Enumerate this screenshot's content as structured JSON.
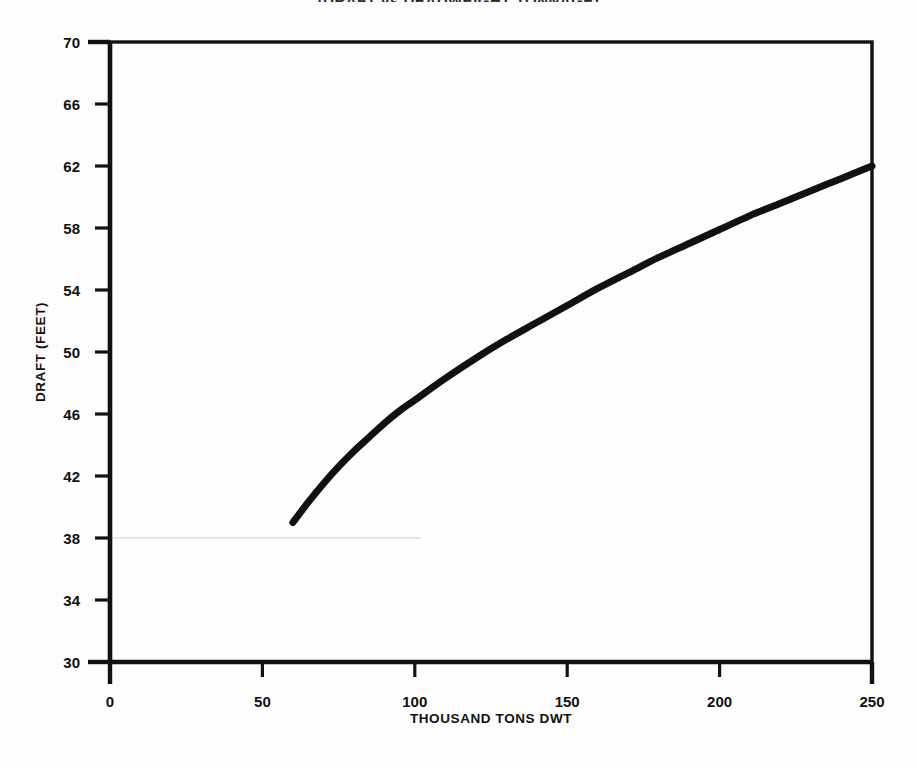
{
  "figure": {
    "clipped_title": "(DRAFT vs DEADWEIGHT TONNAGE)",
    "background_color": "#fdfdfd",
    "ink_color": "#111111"
  },
  "chart_data": {
    "type": "line",
    "title": "",
    "xlabel": "THOUSAND TONS DWT",
    "ylabel": "DRAFT (FEET)",
    "xlim": [
      0,
      250
    ],
    "ylim": [
      30,
      70
    ],
    "xticks": [
      0,
      50,
      100,
      150,
      200,
      250
    ],
    "yticks": [
      30,
      34,
      38,
      42,
      46,
      50,
      54,
      58,
      62,
      66,
      70
    ],
    "xtick_labels": [
      "0",
      "50",
      "100",
      "150",
      "200",
      "250"
    ],
    "ytick_labels": [
      "30",
      "34",
      "38",
      "42",
      "46",
      "50",
      "54",
      "58",
      "62",
      "66",
      "70"
    ],
    "grid": false,
    "legend": null,
    "series": [
      {
        "name": "Draft vs deadweight",
        "line_color": "#111111",
        "line_width": 7,
        "x": [
          60,
          65,
          70,
          75,
          80,
          85,
          90,
          95,
          100,
          110,
          120,
          130,
          140,
          150,
          160,
          170,
          180,
          190,
          200,
          210,
          220,
          230,
          240,
          250
        ],
        "y": [
          39.0,
          40.3,
          41.5,
          42.6,
          43.6,
          44.5,
          45.4,
          46.2,
          46.9,
          48.3,
          49.6,
          50.8,
          51.9,
          53.0,
          54.1,
          55.1,
          56.1,
          57.0,
          57.9,
          58.8,
          59.6,
          60.4,
          61.2,
          62.0
        ]
      }
    ],
    "annotations": [
      {
        "name": "scan-artifact-line",
        "type": "horizontal-line",
        "y": 38,
        "x_start": 0,
        "x_end": 102,
        "color": "#dcdcdc"
      }
    ]
  }
}
